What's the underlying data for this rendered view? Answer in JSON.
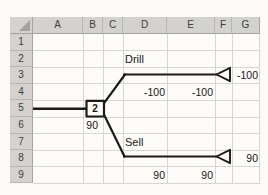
{
  "sheet": {
    "column_headers": [
      "A",
      "B",
      "C",
      "D",
      "E",
      "F",
      "G"
    ],
    "row_headers": [
      "1",
      "2",
      "3",
      "4",
      "5",
      "6",
      "7",
      "8",
      "9"
    ],
    "cells": [
      {
        "ref": "D2",
        "text": "Drill"
      },
      {
        "ref": "G3",
        "text": "-100"
      },
      {
        "ref": "D4",
        "text": "-100"
      },
      {
        "ref": "E4",
        "text": "-100"
      },
      {
        "ref": "B6",
        "text": "90"
      },
      {
        "ref": "D7",
        "text": "Sell"
      },
      {
        "ref": "G8",
        "text": "90"
      },
      {
        "ref": "D9",
        "text": "90"
      },
      {
        "ref": "E9",
        "text": "90"
      }
    ],
    "decision_node_label": "2"
  },
  "colors": {
    "header_bg": "#d3d2ce",
    "gridline": "#d8d6d1",
    "tree_line": "#1c1b19",
    "background": "#fbfaf6"
  }
}
